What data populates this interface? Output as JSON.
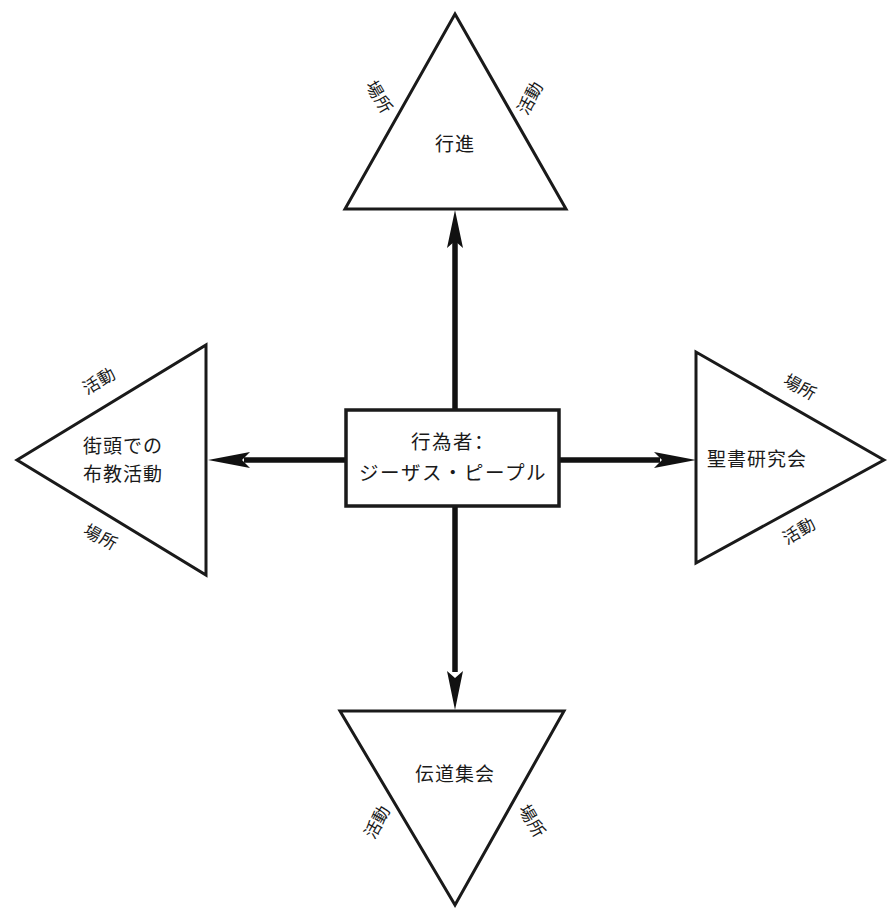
{
  "diagram": {
    "type": "radial-concept-diagram",
    "center": {
      "id": "actor",
      "shape": "rectangle",
      "lines": [
        "行為者：",
        "ジーザス・ピープル"
      ]
    },
    "branches": [
      {
        "id": "march",
        "direction": "up",
        "shape": "triangle-up",
        "label": "行進",
        "edge_labels": {
          "left": "場所",
          "right": "活動"
        }
      },
      {
        "id": "bible-study",
        "direction": "right",
        "shape": "triangle-right",
        "label": "聖書研究会",
        "edge_labels": {
          "upper": "場所",
          "lower": "活動"
        }
      },
      {
        "id": "evangelistic-meeting",
        "direction": "down",
        "shape": "triangle-down",
        "label": "伝道集会",
        "edge_labels": {
          "left": "活動",
          "right": "場所"
        }
      },
      {
        "id": "street-evangelism",
        "direction": "left",
        "shape": "triangle-left",
        "lines": [
          "街頭での",
          "布教活動"
        ],
        "edge_labels": {
          "upper": "活動",
          "lower": "場所"
        }
      }
    ],
    "colors": {
      "background": "#ffffff",
      "stroke": "#1a1a1a",
      "arrow": "#111111",
      "text": "#1a1a1a"
    }
  }
}
